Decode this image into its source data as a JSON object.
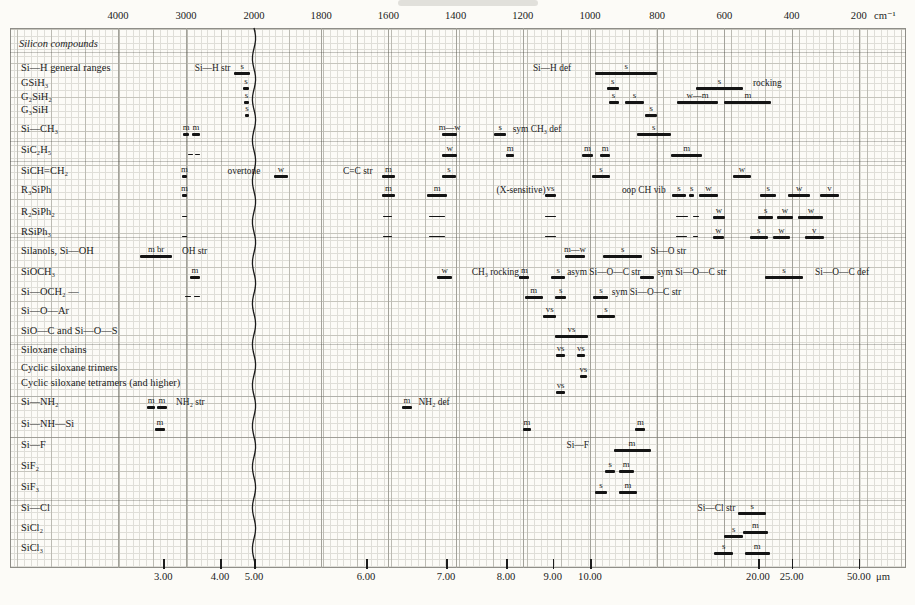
{
  "chart_data": {
    "type": "bar",
    "variant": "infrared spectral correlation chart (horizontal absorption-range bars)",
    "title": "",
    "section_label": "Silicon compounds",
    "colors": {
      "bar": "#141414",
      "paper": "#fcfbf7",
      "grid_minor": "#dfded8",
      "grid_major": "#bcbbb3"
    },
    "top_axis": {
      "unit": "cm⁻¹",
      "ticks": [
        4000,
        3000,
        2000,
        1800,
        1600,
        1400,
        1200,
        1000,
        800,
        600,
        400,
        200
      ],
      "scale_break_at": 2000
    },
    "bottom_axis": {
      "unit": "μm",
      "ticks": [
        {
          "label": "3.00",
          "um": 3
        },
        {
          "label": "4.00",
          "um": 4
        },
        {
          "label": "5.00",
          "um": 5
        },
        {
          "label": "6.00",
          "um": 6
        },
        {
          "label": "7.00",
          "um": 7
        },
        {
          "label": "8.00",
          "um": 8
        },
        {
          "label": "9.00",
          "um": 9
        },
        {
          "label": "10.00",
          "um": 10
        },
        {
          "label": "20.00",
          "um": 20
        },
        {
          "label": "25.00",
          "um": 25
        },
        {
          "label": "50.00",
          "um": 50
        }
      ]
    },
    "rows": [
      {
        "label": "Si—H general ranges",
        "y": 68,
        "items": [
          {
            "type": "text",
            "at": 2870,
            "text": "Si—H str"
          },
          {
            "type": "bar",
            "from": 2290,
            "to": 2060,
            "intensity": "s"
          },
          {
            "type": "text",
            "at": 1170,
            "text": "Si—H def"
          },
          {
            "type": "bar",
            "from": 985,
            "to": 800,
            "intensity": "s"
          }
        ]
      },
      {
        "label": "GSiH₃",
        "y": 83,
        "items": [
          {
            "type": "bar",
            "from": 2160,
            "to": 2075,
            "intensity": "s"
          },
          {
            "type": "bar",
            "from": 950,
            "to": 915,
            "intensity": "s"
          },
          {
            "type": "bar",
            "from": 685,
            "to": 545,
            "intensity": "s"
          },
          {
            "type": "text",
            "at": 515,
            "text": "rocking"
          }
        ]
      },
      {
        "label": "G₂SiH₂",
        "y": 97,
        "items": [
          {
            "type": "bar",
            "from": 2145,
            "to": 2075,
            "intensity": "s"
          },
          {
            "type": "bar",
            "from": 945,
            "to": 915,
            "intensity": "s"
          },
          {
            "type": "bar",
            "from": 895,
            "to": 840,
            "intensity": "s"
          },
          {
            "type": "bar",
            "from": 740,
            "to": 620,
            "intensity": "w—m"
          },
          {
            "type": "bar",
            "from": 600,
            "to": 460,
            "intensity": "m"
          }
        ]
      },
      {
        "label": "G₃SiH",
        "y": 110,
        "items": [
          {
            "type": "bar",
            "from": 2130,
            "to": 2075,
            "intensity": "s"
          },
          {
            "type": "bar",
            "from": 835,
            "to": 800,
            "intensity": "s"
          }
        ]
      },
      {
        "label": "Si—CH₃",
        "y": 129,
        "items": [
          {
            "type": "bar",
            "from": 3040,
            "to": 2955,
            "intensity": "m"
          },
          {
            "type": "bar",
            "from": 2910,
            "to": 2795,
            "intensity": "m"
          },
          {
            "type": "bar",
            "from": 1440,
            "to": 1395,
            "intensity": "m—w"
          },
          {
            "type": "bar",
            "from": 1285,
            "to": 1250,
            "intensity": "s"
          },
          {
            "type": "text",
            "at": 1230,
            "text": "sym CH₃ def"
          },
          {
            "type": "bar",
            "from": 860,
            "to": 760,
            "intensity": "s"
          }
        ]
      },
      {
        "label": "SiC₂H₅",
        "y": 150,
        "items": [
          {
            "type": "bar",
            "from": 2965,
            "to": 2895,
            "thin": true
          },
          {
            "type": "bar",
            "from": 2870,
            "to": 2795,
            "thin": true
          },
          {
            "type": "bar",
            "from": 1440,
            "to": 1395,
            "intensity": "w"
          },
          {
            "type": "bar",
            "from": 1250,
            "to": 1225,
            "intensity": "m"
          },
          {
            "type": "bar",
            "from": 1025,
            "to": 990,
            "intensity": "m"
          },
          {
            "type": "bar",
            "from": 970,
            "to": 940,
            "intensity": "m"
          },
          {
            "type": "bar",
            "from": 760,
            "to": 665,
            "intensity": "m"
          }
        ]
      },
      {
        "label": "SiCH=CH₂",
        "y": 171,
        "items": [
          {
            "type": "bar",
            "from": 3060,
            "to": 2985,
            "intensity": "m"
          },
          {
            "type": "text",
            "at": 2390,
            "text": "overtone"
          },
          {
            "type": "bar",
            "from": 1940,
            "to": 1900,
            "intensity": "w"
          },
          {
            "type": "text",
            "at": 1735,
            "text": "C=C str"
          },
          {
            "type": "bar",
            "from": 1620,
            "to": 1580,
            "intensity": "m"
          },
          {
            "type": "bar",
            "from": 1440,
            "to": 1400,
            "intensity": "s"
          },
          {
            "type": "bar",
            "from": 995,
            "to": 940,
            "intensity": "s"
          },
          {
            "type": "bar",
            "from": 575,
            "to": 520,
            "intensity": "w"
          }
        ]
      },
      {
        "label": "R₃SiPh",
        "y": 190,
        "items": [
          {
            "type": "bar",
            "from": 3060,
            "to": 2985,
            "intensity": "m"
          },
          {
            "type": "bar",
            "from": 1620,
            "to": 1580,
            "intensity": "m"
          },
          {
            "type": "bar",
            "from": 1485,
            "to": 1425,
            "intensity": "m"
          },
          {
            "type": "text",
            "at": 1278,
            "text": "(X-sensitive)"
          },
          {
            "type": "bar",
            "from": 1135,
            "to": 1100,
            "intensity": "vs"
          },
          {
            "type": "text",
            "at": 905,
            "text": "oop CH vib"
          },
          {
            "type": "bar",
            "from": 755,
            "to": 715,
            "intensity": "s"
          },
          {
            "type": "bar",
            "from": 705,
            "to": 690,
            "intensity": "s"
          },
          {
            "type": "bar",
            "from": 675,
            "to": 620,
            "intensity": "w"
          },
          {
            "type": "bar",
            "from": 495,
            "to": 445,
            "intensity": "s"
          },
          {
            "type": "bar",
            "from": 410,
            "to": 345,
            "intensity": "w"
          },
          {
            "type": "bar",
            "from": 315,
            "to": 260,
            "intensity": "v"
          }
        ]
      },
      {
        "label": "R₂SiPh₂",
        "y": 212,
        "items": [
          {
            "type": "bar",
            "from": 3060,
            "to": 2985,
            "thin": true
          },
          {
            "type": "bar",
            "from": 1615,
            "to": 1590,
            "thin": true
          },
          {
            "type": "bar",
            "from": 1480,
            "to": 1430,
            "thin": true
          },
          {
            "type": "bar",
            "from": 1135,
            "to": 1100,
            "thin": true
          },
          {
            "type": "bar",
            "from": 745,
            "to": 708,
            "thin": true
          },
          {
            "type": "bar",
            "from": 695,
            "to": 675,
            "thin": true
          },
          {
            "type": "bar",
            "from": 635,
            "to": 598,
            "intensity": "w"
          },
          {
            "type": "bar",
            "from": 500,
            "to": 455,
            "intensity": "s"
          },
          {
            "type": "bar",
            "from": 445,
            "to": 395,
            "intensity": "w"
          },
          {
            "type": "bar",
            "from": 380,
            "to": 305,
            "intensity": "w"
          }
        ]
      },
      {
        "label": "RSiPh₃",
        "y": 232,
        "items": [
          {
            "type": "bar",
            "from": 3060,
            "to": 2985,
            "thin": true
          },
          {
            "type": "bar",
            "from": 1615,
            "to": 1590,
            "thin": true
          },
          {
            "type": "bar",
            "from": 1480,
            "to": 1430,
            "thin": true
          },
          {
            "type": "bar",
            "from": 1135,
            "to": 1100,
            "thin": true
          },
          {
            "type": "bar",
            "from": 745,
            "to": 710,
            "thin": true
          },
          {
            "type": "bar",
            "from": 695,
            "to": 678,
            "thin": true
          },
          {
            "type": "bar",
            "from": 635,
            "to": 600,
            "intensity": "w"
          },
          {
            "type": "bar",
            "from": 525,
            "to": 470,
            "intensity": "s"
          },
          {
            "type": "bar",
            "from": 455,
            "to": 405,
            "intensity": "w"
          },
          {
            "type": "bar",
            "from": 360,
            "to": 305,
            "intensity": "v"
          }
        ]
      },
      {
        "label": "Silanols, Si—OH",
        "y": 251,
        "items": [
          {
            "type": "bar",
            "from": 3680,
            "to": 3200,
            "intensity": "m br"
          },
          {
            "type": "text",
            "at": 3060,
            "text": "OH str"
          },
          {
            "type": "bar",
            "from": 1075,
            "to": 1015,
            "intensity": "m—w"
          },
          {
            "type": "bar",
            "from": 960,
            "to": 845,
            "intensity": "s"
          },
          {
            "type": "text",
            "at": 820,
            "text": "Si—O str"
          }
        ]
      },
      {
        "label": "SiOCH₃",
        "y": 272,
        "items": [
          {
            "type": "bar",
            "from": 2940,
            "to": 2795,
            "intensity": "m"
          },
          {
            "type": "bar",
            "from": 1455,
            "to": 1410,
            "intensity": "w"
          },
          {
            "type": "text",
            "at": 1352,
            "text": "CH₃ rocking"
          },
          {
            "type": "bar",
            "from": 1210,
            "to": 1180,
            "intensity": "m"
          },
          {
            "type": "bar",
            "from": 1115,
            "to": 1075,
            "intensity": "s"
          },
          {
            "type": "text",
            "at": 1068,
            "text": "asym Si—O—C str"
          },
          {
            "type": "bar",
            "from": 850,
            "to": 810
          },
          {
            "type": "text",
            "at": 800,
            "text": "sym Si—O—C str"
          },
          {
            "type": "bar",
            "from": 480,
            "to": 365,
            "intensity": "s"
          },
          {
            "type": "text",
            "at": 330,
            "text": "Si—O—C def"
          }
        ]
      },
      {
        "label": "Si—OCH₂ —",
        "y": 292,
        "items": [
          {
            "type": "bar",
            "from": 3015,
            "to": 2925,
            "thin": true
          },
          {
            "type": "bar",
            "from": 2880,
            "to": 2795,
            "thin": true
          },
          {
            "type": "bar",
            "from": 1195,
            "to": 1140,
            "intensity": "m"
          },
          {
            "type": "bar",
            "from": 1105,
            "to": 1070,
            "intensity": "s"
          },
          {
            "type": "bar",
            "from": 990,
            "to": 945,
            "intensity": "s"
          },
          {
            "type": "text",
            "at": 935,
            "text": "sym Si—O—C str"
          }
        ]
      },
      {
        "label": "Si—O—Ar",
        "y": 311,
        "items": [
          {
            "type": "bar",
            "from": 1140,
            "to": 1100,
            "intensity": "vs"
          },
          {
            "type": "bar",
            "from": 980,
            "to": 925,
            "intensity": "s"
          }
        ]
      },
      {
        "label": "SiO—C and Si—O—S",
        "y": 331,
        "items": [
          {
            "type": "bar",
            "from": 1105,
            "to": 1005,
            "intensity": "vs"
          }
        ]
      },
      {
        "label": "Siloxane chains",
        "y": 350,
        "items": [
          {
            "type": "bar",
            "from": 1100,
            "to": 1075,
            "intensity": "vs"
          },
          {
            "type": "bar",
            "from": 1040,
            "to": 1015,
            "intensity": "vs"
          }
        ]
      },
      {
        "label": "Cyclic siloxane trimers",
        "y": 368,
        "items": [
          {
            "type": "bar",
            "from": 1030,
            "to": 1010,
            "intensity": "vs",
            "dy": 7
          }
        ]
      },
      {
        "label": "Cyclic siloxane tetramers (and higher)",
        "y": 383,
        "items": [
          {
            "type": "bar",
            "from": 1100,
            "to": 1075,
            "intensity": "vs",
            "dy": 8
          }
        ]
      },
      {
        "label": "Si—NH₂",
        "y": 402,
        "items": [
          {
            "type": "bar",
            "from": 3570,
            "to": 3455,
            "intensity": "m"
          },
          {
            "type": "bar",
            "from": 3425,
            "to": 3280,
            "intensity": "m"
          },
          {
            "type": "text",
            "at": 3145,
            "text": "NH₂ str"
          },
          {
            "type": "bar",
            "from": 1560,
            "to": 1530,
            "intensity": "m"
          },
          {
            "type": "text",
            "at": 1510,
            "text": "NH₂ def"
          }
        ]
      },
      {
        "label": "Si—NH—Si",
        "y": 424,
        "items": [
          {
            "type": "bar",
            "from": 3455,
            "to": 3310,
            "intensity": "m"
          },
          {
            "type": "bar",
            "from": 1200,
            "to": 1175,
            "intensity": "m"
          },
          {
            "type": "bar",
            "from": 865,
            "to": 835,
            "intensity": "m"
          }
        ]
      },
      {
        "label": "Si—F",
        "y": 445,
        "items": [
          {
            "type": "text",
            "at": 1070,
            "text": "Si—F"
          },
          {
            "type": "bar",
            "from": 930,
            "to": 820,
            "intensity": "m"
          }
        ]
      },
      {
        "label": "SiF₂",
        "y": 466,
        "items": [
          {
            "type": "bar",
            "from": 955,
            "to": 925,
            "intensity": "s"
          },
          {
            "type": "bar",
            "from": 915,
            "to": 870,
            "intensity": "m"
          }
        ]
      },
      {
        "label": "SiF₃",
        "y": 487,
        "items": [
          {
            "type": "bar",
            "from": 985,
            "to": 950,
            "intensity": "s"
          },
          {
            "type": "bar",
            "from": 915,
            "to": 860,
            "intensity": "m"
          }
        ]
      },
      {
        "label": "Si—Cl",
        "y": 508,
        "items": [
          {
            "type": "text",
            "at": 680,
            "text": "Si—Cl str"
          },
          {
            "type": "bar",
            "from": 560,
            "to": 475,
            "intensity": "s"
          }
        ]
      },
      {
        "label": "SiCl₂",
        "y": 528,
        "items": [
          {
            "type": "bar",
            "from": 600,
            "to": 545,
            "intensity": "s",
            "dy": 7
          },
          {
            "type": "bar",
            "from": 545,
            "to": 470,
            "intensity": "m",
            "dy": 3
          }
        ]
      },
      {
        "label": "SiCl₃",
        "y": 548,
        "items": [
          {
            "type": "bar",
            "from": 630,
            "to": 575,
            "intensity": "s"
          },
          {
            "type": "bar",
            "from": 540,
            "to": 465,
            "intensity": "m"
          }
        ]
      }
    ]
  }
}
